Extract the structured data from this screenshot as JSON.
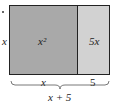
{
  "diagram": {
    "colors": {
      "left_fill": "#a9a9a9",
      "right_fill": "#d2d2d2",
      "border": "#222222"
    },
    "labels": {
      "side_height": "x",
      "left_area": "x²",
      "right_area": "5x",
      "bottom_left": "x",
      "bottom_right": "5",
      "total_width": "x + 5"
    }
  }
}
